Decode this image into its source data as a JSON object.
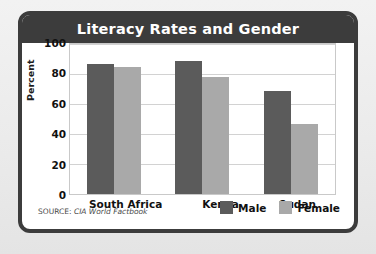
{
  "figure": {
    "title": "Literacy Rates and Gender",
    "source_lead": "SOURCE:",
    "source_body": "CIA World Factbook"
  },
  "colors": {
    "male": "#5b5b5b",
    "female": "#a9a9a9",
    "title_bar": "#3c3c3c",
    "frame": "#3c3c3c",
    "plot_background": "#ffffff",
    "gridline": "#d2d2d2",
    "page_background": "#ebebeb"
  },
  "legend": {
    "items": [
      {
        "label": "Male",
        "key": "male"
      },
      {
        "label": "Female",
        "key": "female"
      }
    ]
  },
  "chart_data": {
    "type": "bar",
    "title": "Literacy Rates and Gender",
    "xlabel": "",
    "ylabel": "Percent",
    "categories": [
      "South Africa",
      "Kenya",
      "Sudan"
    ],
    "series": [
      {
        "name": "Male",
        "values": [
          87,
          89,
          69
        ]
      },
      {
        "name": "Female",
        "values": [
          85,
          78,
          47
        ]
      }
    ],
    "ylim": [
      0,
      100
    ],
    "yticks": [
      0,
      20,
      40,
      60,
      80,
      100
    ],
    "ytick_labels": [
      "0",
      "20",
      "40",
      "60",
      "80",
      "100"
    ],
    "grid": true,
    "legend_position": "bottom-right",
    "annotations": [
      "SOURCE: CIA World Factbook"
    ]
  }
}
